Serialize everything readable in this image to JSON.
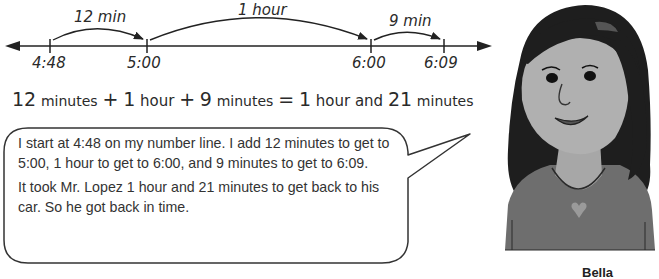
{
  "number_line": {
    "ticks": [
      {
        "label": "4:48",
        "x": 50
      },
      {
        "label": "5:00",
        "x": 147
      },
      {
        "label": "6:00",
        "x": 371
      },
      {
        "label": "6:09",
        "x": 444
      }
    ],
    "jumps": [
      {
        "label": "12 min",
        "from": "4:48",
        "to": "5:00"
      },
      {
        "label": "1 hour",
        "from": "5:00",
        "to": "6:00"
      },
      {
        "label": "9 min",
        "from": "6:00",
        "to": "6:09"
      }
    ]
  },
  "equation": {
    "term1_num": "12",
    "term1_unit": "minutes",
    "plus1": "+",
    "term2_num": "1",
    "term2_unit": "hour",
    "plus2": "+",
    "term3_num": "9",
    "term3_unit": "minutes",
    "equals": "=",
    "result_hours": "1",
    "result_hours_unit": "hour and",
    "result_minutes": "21",
    "result_minutes_unit": "minutes"
  },
  "speech_bubble": {
    "paragraph1": "I start at 4:48 on my number line. I add 12 minutes to get to 5:00, 1 hour to get to 6:00, and 9 minutes to get to 6:09.",
    "paragraph2": "It took Mr. Lopez 1 hour and 21 minutes to get back to his car. So he got back in time."
  },
  "character": {
    "name": "Bella",
    "icon": "girl-portrait-illustration"
  }
}
